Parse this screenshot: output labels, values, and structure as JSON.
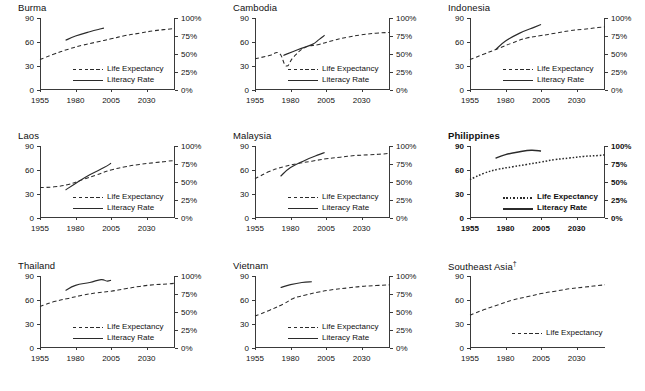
{
  "figure": {
    "panel_titles": [
      "Burma",
      "Cambodia",
      "Indonesia",
      "Laos",
      "Malaysia",
      "Philippines",
      "Thailand",
      "Vietnam",
      "Southeast Asia"
    ],
    "southeast_asia_footnote_marker": "†",
    "legend": {
      "life_expectancy": "Life Expectancy",
      "literacy_rate": "Literacy Rate"
    },
    "colors": {
      "line": "#2b2b2b",
      "axis": "#3a3a3a",
      "background": "#ffffff",
      "text": "#111111"
    },
    "axes": {
      "y_left_ticks": [
        "0",
        "30",
        "60",
        "90"
      ],
      "y_right_ticks": [
        "0%",
        "25%",
        "50%",
        "75%",
        "100%"
      ],
      "x_ticks": [
        "1955",
        "1980",
        "2005",
        "2030"
      ]
    }
  },
  "chart_data": {
    "type": "line",
    "xlabel": "",
    "ylabel": "Life expectancy (years)",
    "y2label": "Literacy rate (%)",
    "xlim": [
      1955,
      2050
    ],
    "ylim": [
      0,
      90
    ],
    "y2lim": [
      0,
      100
    ],
    "xticks": [
      1955,
      1980,
      2005,
      2030
    ],
    "yticks": [
      0,
      30,
      60,
      90
    ],
    "y2ticks": [
      0,
      25,
      50,
      75,
      100
    ],
    "grid": false,
    "legend_position": "center",
    "panels": [
      {
        "name": "Burma",
        "series": [
          {
            "name": "Life Expectancy",
            "style": "dashed",
            "axis": "left",
            "x": [
              1955,
              1965,
              1975,
              1985,
              1995,
              2005,
              2015,
              2025,
              2035,
              2045,
              2050
            ],
            "values": [
              38,
              45,
              51,
              56,
              60,
              64,
              68,
              71,
              74,
              76,
              77
            ]
          },
          {
            "name": "Literacy Rate",
            "style": "solid",
            "axis": "right",
            "x": [
              1973,
              1980,
              1990,
              1998,
              2000
            ],
            "values": [
              69,
              75,
              81,
              85,
              86
            ]
          }
        ]
      },
      {
        "name": "Cambodia",
        "series": [
          {
            "name": "Life Expectancy",
            "style": "dashed",
            "axis": "left",
            "x": [
              1955,
              1965,
              1972,
              1977,
              1982,
              1990,
              2000,
              2010,
              2020,
              2030,
              2040,
              2050
            ],
            "values": [
              39,
              43,
              46,
              30,
              41,
              53,
              57,
              62,
              66,
              69,
              71,
              72
            ]
          },
          {
            "name": "Literacy Rate",
            "style": "solid",
            "axis": "right",
            "x": [
              1975,
              1985,
              1995,
              2000,
              2004
            ],
            "values": [
              48,
              56,
              63,
              70,
              76
            ]
          }
        ]
      },
      {
        "name": "Indonesia",
        "series": [
          {
            "name": "Life Expectancy",
            "style": "dashed",
            "axis": "left",
            "x": [
              1955,
              1965,
              1975,
              1985,
              1995,
              2005,
              2015,
              2025,
              2035,
              2045,
              2050
            ],
            "values": [
              38,
              45,
              52,
              59,
              65,
              68,
              71,
              74,
              76,
              78,
              79
            ]
          },
          {
            "name": "Literacy Rate",
            "style": "solid",
            "axis": "right",
            "x": [
              1973,
              1980,
              1990,
              2000,
              2005
            ],
            "values": [
              56,
              68,
              79,
              87,
              91
            ]
          }
        ]
      },
      {
        "name": "Laos",
        "series": [
          {
            "name": "Life Expectancy",
            "style": "dashed",
            "axis": "left",
            "x": [
              1955,
              1965,
              1975,
              1985,
              1995,
              2005,
              2015,
              2025,
              2035,
              2045,
              2050
            ],
            "values": [
              38,
              39,
              42,
              48,
              54,
              60,
              64,
              67,
              69,
              71,
              72
            ]
          },
          {
            "name": "Literacy Rate",
            "style": "solid",
            "axis": "right",
            "x": [
              1973,
              1980,
              1990,
              2000,
              2005
            ],
            "values": [
              39,
              48,
              60,
              70,
              76
            ]
          }
        ]
      },
      {
        "name": "Malaysia",
        "series": [
          {
            "name": "Life Expectancy",
            "style": "dashed",
            "axis": "left",
            "x": [
              1955,
              1965,
              1975,
              1985,
              1995,
              2005,
              2015,
              2025,
              2035,
              2045,
              2050
            ],
            "values": [
              49,
              58,
              64,
              68,
              71,
              74,
              76,
              78,
              79,
              80,
              81
            ]
          },
          {
            "name": "Literacy Rate",
            "style": "solid",
            "axis": "right",
            "x": [
              1973,
              1980,
              1990,
              2000,
              2004
            ],
            "values": [
              58,
              70,
              80,
              88,
              91
            ]
          }
        ]
      },
      {
        "name": "Philippines",
        "bold": true,
        "series": [
          {
            "name": "Life Expectancy",
            "style": "dotted",
            "axis": "left",
            "x": [
              1955,
              1965,
              1975,
              1985,
              1995,
              2005,
              2015,
              2025,
              2035,
              2045,
              2050
            ],
            "values": [
              48,
              56,
              61,
              64,
              67,
              70,
              73,
              75,
              77,
              78,
              79
            ]
          },
          {
            "name": "Literacy Rate",
            "style": "solid",
            "axis": "right",
            "x": [
              1973,
              1980,
              1990,
              1998,
              2005
            ],
            "values": [
              83,
              88,
              92,
              94,
              93
            ]
          }
        ]
      },
      {
        "name": "Thailand",
        "series": [
          {
            "name": "Life Expectancy",
            "style": "dashed",
            "axis": "left",
            "x": [
              1955,
              1965,
              1975,
              1985,
              1995,
              2005,
              2015,
              2025,
              2035,
              2045,
              2050
            ],
            "values": [
              52,
              58,
              62,
              66,
              69,
              71,
              74,
              77,
              79,
              80,
              81
            ]
          },
          {
            "name": "Literacy Rate",
            "style": "solid",
            "axis": "right",
            "x": [
              1973,
              1980,
              1990,
              1998,
              2002,
              2005
            ],
            "values": [
              80,
              87,
              91,
              95,
              93,
              94
            ]
          }
        ]
      },
      {
        "name": "Vietnam",
        "series": [
          {
            "name": "Life Expectancy",
            "style": "dashed",
            "axis": "left",
            "x": [
              1955,
              1965,
              1975,
              1982,
              1990,
              2000,
              2010,
              2020,
              2030,
              2040,
              2050
            ],
            "values": [
              40,
              47,
              55,
              62,
              66,
              70,
              73,
              75,
              77,
              78,
              79
            ]
          },
          {
            "name": "Literacy Rate",
            "style": "solid",
            "axis": "right",
            "x": [
              1973,
              1980,
              1988,
              1995
            ],
            "values": [
              84,
              88,
              91,
              92
            ]
          }
        ]
      },
      {
        "name": "Southeast Asia",
        "no_right_axis": true,
        "series": [
          {
            "name": "Life Expectancy",
            "style": "dashed",
            "axis": "left",
            "x": [
              1955,
              1965,
              1975,
              1985,
              1995,
              2005,
              2015,
              2025,
              2035,
              2045,
              2050
            ],
            "values": [
              41,
              48,
              54,
              60,
              64,
              68,
              71,
              74,
              76,
              78,
              79
            ]
          }
        ]
      }
    ]
  }
}
